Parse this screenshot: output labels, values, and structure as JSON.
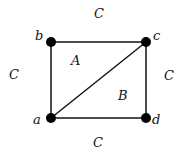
{
  "diagram": {
    "type": "planar-graph",
    "vertices": [
      {
        "id": "a",
        "label": "a",
        "x": 51,
        "y": 118,
        "lx": 33,
        "ly": 124
      },
      {
        "id": "b",
        "label": "b",
        "x": 51,
        "y": 42,
        "lx": 35,
        "ly": 40
      },
      {
        "id": "c",
        "label": "c",
        "x": 146,
        "y": 42,
        "lx": 153,
        "ly": 40
      },
      {
        "id": "d",
        "label": "d",
        "x": 146,
        "y": 118,
        "lx": 152,
        "ly": 124
      }
    ],
    "edges": [
      {
        "from": "b",
        "to": "c"
      },
      {
        "from": "b",
        "to": "a"
      },
      {
        "from": "c",
        "to": "d"
      },
      {
        "from": "a",
        "to": "d"
      },
      {
        "from": "a",
        "to": "c"
      }
    ],
    "faces": [
      {
        "label": "A",
        "x": 71,
        "y": 65
      },
      {
        "label": "B",
        "x": 118,
        "y": 100
      },
      {
        "label": "C",
        "x": 94,
        "y": 18
      },
      {
        "label": "C",
        "x": 9,
        "y": 79
      },
      {
        "label": "C",
        "x": 164,
        "y": 80
      },
      {
        "label": "C",
        "x": 93,
        "y": 147
      }
    ],
    "colors": {
      "stroke": "#111111",
      "vertex": "#000000"
    }
  }
}
